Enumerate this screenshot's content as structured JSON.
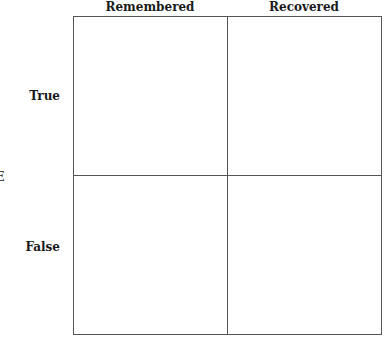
{
  "diagram": {
    "type": "2x2 matrix",
    "column_headers": [
      "Remembered",
      "Recovered"
    ],
    "row_headers": [
      "True",
      "False"
    ],
    "row_axis_label": "UE",
    "cells": [
      [
        "",
        ""
      ],
      [
        "",
        ""
      ]
    ],
    "colors": {
      "line": "#555555",
      "text": "#1a1a1a",
      "background": "#ffffff"
    }
  }
}
